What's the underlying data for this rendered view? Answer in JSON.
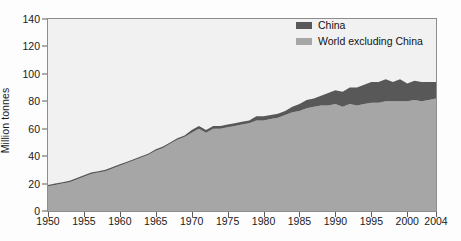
{
  "chart_data": {
    "type": "area",
    "stacked": true,
    "title": "",
    "subtitle": "",
    "xlabel": "",
    "ylabel": "Million tonnes",
    "ylim": [
      0,
      140
    ],
    "xlim": [
      1950,
      2004
    ],
    "ytick_labels": [
      "0",
      "20",
      "40",
      "60",
      "80",
      "100",
      "120",
      "140"
    ],
    "ytick_values": [
      0,
      20,
      40,
      60,
      80,
      100,
      120,
      140
    ],
    "xtick_labels": [
      "1950",
      "1955",
      "1960",
      "1965",
      "1970",
      "1975",
      "1980",
      "1985",
      "1990",
      "1995",
      "2000",
      "2004"
    ],
    "xtick_values": [
      1950,
      1955,
      1960,
      1965,
      1970,
      1975,
      1980,
      1985,
      1990,
      1995,
      2000,
      2004
    ],
    "grid": false,
    "legend_position": "top-right",
    "x": [
      1950,
      1951,
      1952,
      1953,
      1954,
      1955,
      1956,
      1957,
      1958,
      1959,
      1960,
      1961,
      1962,
      1963,
      1964,
      1965,
      1966,
      1967,
      1968,
      1969,
      1970,
      1971,
      1972,
      1973,
      1974,
      1975,
      1976,
      1977,
      1978,
      1979,
      1980,
      1981,
      1982,
      1983,
      1984,
      1985,
      1986,
      1987,
      1988,
      1989,
      1990,
      1991,
      1992,
      1993,
      1994,
      1995,
      1996,
      1997,
      1998,
      1999,
      2000,
      2001,
      2002,
      2003,
      2004
    ],
    "series": [
      {
        "name": "World excluding China",
        "color": "#a6a6a6",
        "values": [
          18,
          19,
          20,
          21,
          23,
          25,
          27,
          28,
          29,
          31,
          33,
          35,
          37,
          39,
          41,
          44,
          46,
          49,
          52,
          54,
          57,
          60,
          57,
          60,
          60,
          61,
          62,
          63,
          64,
          66,
          66,
          67,
          68,
          70,
          72,
          73,
          75,
          76,
          77,
          77,
          78,
          76,
          78,
          77,
          78,
          79,
          79,
          80,
          80,
          80,
          80,
          81,
          80,
          81,
          82
        ]
      },
      {
        "name": "China",
        "color": "#585858",
        "values": [
          1,
          1,
          1,
          1,
          1,
          1,
          1,
          1,
          1,
          1,
          1,
          1,
          1,
          1,
          1,
          1,
          1,
          1,
          1,
          1,
          2,
          2,
          2,
          2,
          2,
          2,
          2,
          2,
          2,
          3,
          3,
          3,
          3,
          3,
          4,
          5,
          6,
          6,
          7,
          9,
          10,
          11,
          12,
          13,
          14,
          15,
          15,
          16,
          14,
          16,
          13,
          14,
          14,
          13,
          12
        ]
      }
    ],
    "totals": [
      19,
      20,
      21,
      22,
      24,
      26,
      28,
      29,
      30,
      32,
      34,
      36,
      38,
      40,
      42,
      45,
      47,
      50,
      53,
      55,
      59,
      62,
      59,
      62,
      62,
      63,
      64,
      65,
      66,
      69,
      69,
      70,
      71,
      73,
      76,
      78,
      81,
      82,
      84,
      86,
      88,
      87,
      90,
      90,
      92,
      94,
      94,
      96,
      94,
      96,
      93,
      95,
      94,
      94,
      94
    ]
  },
  "legend": {
    "items": [
      {
        "label": "China",
        "color": "#585858"
      },
      {
        "label": "World excluding China",
        "color": "#a6a6a6"
      }
    ]
  },
  "axes": {
    "y_title": "Million tonnes"
  }
}
